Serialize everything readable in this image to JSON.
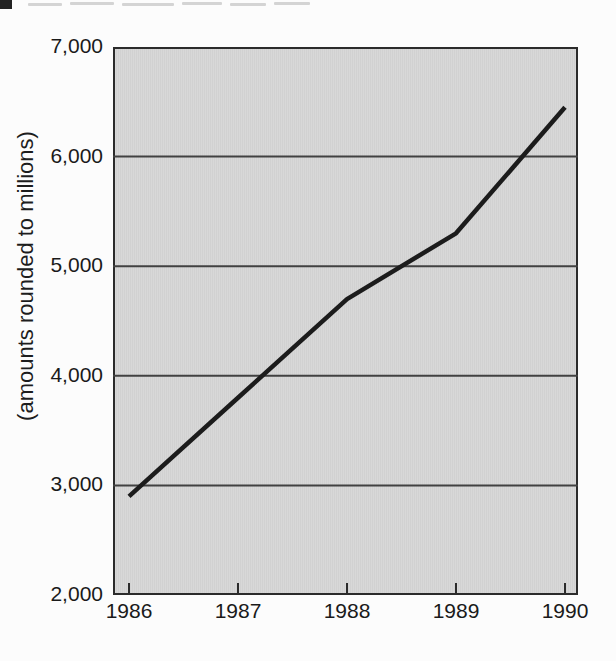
{
  "chart_data": {
    "type": "line",
    "title": "",
    "x": [
      1986,
      1987,
      1988,
      1989,
      1990
    ],
    "xtick_labels": [
      "1986",
      "1987",
      "1988",
      "1989",
      "1990"
    ],
    "series": [
      {
        "name": "amount",
        "values": [
          2900,
          3800,
          4700,
          5300,
          6450
        ]
      }
    ],
    "xlabel": "",
    "ylabel": "(amounts rounded to millions)",
    "ylim": [
      2000,
      7000
    ],
    "yticks": [
      2000,
      3000,
      4000,
      5000,
      6000,
      7000
    ],
    "ytick_labels": [
      "2,000",
      "3,000",
      "4,000",
      "5,000",
      "6,000",
      "7,000"
    ],
    "grid": "horizontal",
    "legend": "none",
    "colors": {
      "plot_background": "#d5d5d5",
      "grid_line": "#414141",
      "axis_border": "#2b2b2b",
      "data_line": "#1c1c1c",
      "text": "#1a1a1a",
      "heading_marker": "#222222"
    }
  }
}
